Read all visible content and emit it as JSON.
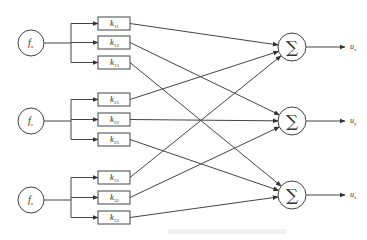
{
  "diagram": {
    "type": "controller-decoupling-network",
    "inputs": [
      {
        "id": "f1",
        "symbol": "f",
        "subscript": "u",
        "cx": 31,
        "cy": 43
      },
      {
        "id": "f2",
        "symbol": "f",
        "subscript": "v",
        "cx": 31,
        "cy": 121
      },
      {
        "id": "f3",
        "symbol": "f",
        "subscript": "a",
        "cx": 31,
        "cy": 200
      }
    ],
    "gains": [
      {
        "label": "k",
        "sub": "11",
        "x": 98,
        "y": 17,
        "input": 0,
        "sum": 0
      },
      {
        "label": "k",
        "sub": "12",
        "x": 98,
        "y": 36,
        "input": 0,
        "sum": 1
      },
      {
        "label": "k",
        "sub": "13",
        "x": 98,
        "y": 56,
        "input": 0,
        "sum": 2
      },
      {
        "label": "k",
        "sub": "21",
        "x": 98,
        "y": 93,
        "input": 1,
        "sum": 0
      },
      {
        "label": "k",
        "sub": "22",
        "x": 98,
        "y": 113,
        "input": 1,
        "sum": 1
      },
      {
        "label": "k",
        "sub": "23",
        "x": 98,
        "y": 133,
        "input": 1,
        "sum": 2
      },
      {
        "label": "k",
        "sub": "31",
        "x": 98,
        "y": 171,
        "input": 2,
        "sum": 0
      },
      {
        "label": "k",
        "sub": "32",
        "x": 98,
        "y": 191,
        "input": 2,
        "sum": 1
      },
      {
        "label": "k",
        "sub": "33",
        "x": 98,
        "y": 211,
        "input": 2,
        "sum": 2
      }
    ],
    "sums": [
      {
        "symbol": "∑",
        "cx": 292,
        "cy": 47
      },
      {
        "symbol": "∑",
        "cx": 292,
        "cy": 121
      },
      {
        "symbol": "∑",
        "cx": 292,
        "cy": 195
      }
    ],
    "outputs": [
      {
        "symbol": "u",
        "subscript": "x"
      },
      {
        "symbol": "u",
        "subscript": "y"
      },
      {
        "symbol": "u",
        "subscript": "z"
      }
    ],
    "colors": {
      "stroke": "#444444",
      "text": "#333333",
      "background": "#ffffff"
    }
  }
}
